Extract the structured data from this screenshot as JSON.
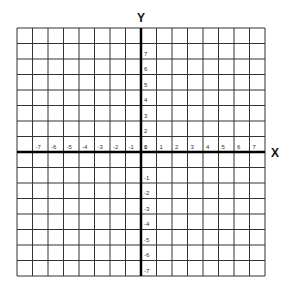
{
  "chart_data": {
    "type": "coordinate-grid",
    "title": "",
    "xlabel": "X",
    "ylabel": "Y",
    "xlim": [
      -8,
      8
    ],
    "ylim": [
      -8,
      8
    ],
    "grid": true,
    "x_ticks": [
      "-7",
      "-6",
      "-5",
      "-4",
      "-3",
      "-2",
      "-1",
      "0",
      "1",
      "2",
      "3",
      "4",
      "5",
      "6",
      "7"
    ],
    "y_ticks": [
      "7",
      "6",
      "5",
      "4",
      "3",
      "2",
      "1",
      "-1",
      "-2",
      "-3",
      "-4",
      "-5",
      "-6",
      "-7"
    ]
  },
  "axes": {
    "x_label": "X",
    "y_label": "Y"
  }
}
